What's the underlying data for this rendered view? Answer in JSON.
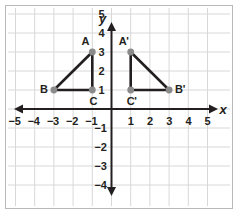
{
  "figure": {
    "background_color": "#ffffff",
    "frame_color": "#b9b9b9",
    "grid_color": "#d8d8d8",
    "axis_color": "#231f20",
    "shape_color": "#231f20",
    "vertex_color": "#8a8a8a"
  },
  "axes": {
    "x_label": "x",
    "y_label": "y",
    "x_ticks": [
      "−5",
      "−4",
      "−3",
      "−2",
      "−1",
      "1",
      "2",
      "3",
      "4",
      "5"
    ],
    "x_tick_values": [
      -5,
      -4,
      -3,
      -2,
      -1,
      1,
      2,
      3,
      4,
      5
    ],
    "y_ticks": [
      "5",
      "4",
      "3",
      "2",
      "1",
      "−1",
      "−2",
      "−3",
      "−4"
    ],
    "y_tick_values": [
      5,
      4,
      3,
      2,
      1,
      -1,
      -2,
      -3,
      -4
    ],
    "xlim": [
      -5.8,
      5.8
    ],
    "ylim": [
      -4.6,
      5.6
    ],
    "grid": true,
    "arrows": "both-ends-both-axes"
  },
  "chart_data": {
    "type": "scatter",
    "title": "",
    "xlabel": "x",
    "ylabel": "y",
    "xlim": [
      -5.8,
      5.8
    ],
    "ylim": [
      -4.6,
      5.6
    ],
    "grid": true,
    "series": [
      {
        "name": "Triangle ABC",
        "closed": true,
        "points": [
          {
            "label": "A",
            "x": -1,
            "y": 3,
            "label_pos": "above-left"
          },
          {
            "label": "B",
            "x": -3,
            "y": 1,
            "label_pos": "left"
          },
          {
            "label": "C",
            "x": -1,
            "y": 1,
            "label_pos": "below"
          }
        ]
      },
      {
        "name": "Triangle A'B'C'",
        "closed": true,
        "points": [
          {
            "label": "A'",
            "x": 1,
            "y": 3,
            "label_pos": "above-left"
          },
          {
            "label": "B'",
            "x": 3,
            "y": 1,
            "label_pos": "right"
          },
          {
            "label": "C'",
            "x": 1,
            "y": 1,
            "label_pos": "below"
          }
        ]
      }
    ]
  }
}
